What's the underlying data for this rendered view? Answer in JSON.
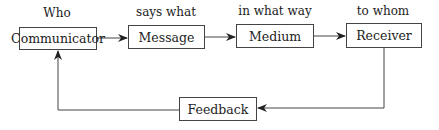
{
  "diagram": {
    "nodes": [
      {
        "id": "communicator",
        "label": "Communicator",
        "caption": "Who"
      },
      {
        "id": "message",
        "label": "Message",
        "caption": "says what"
      },
      {
        "id": "medium",
        "label": "Medium",
        "caption": "in what way"
      },
      {
        "id": "receiver",
        "label": "Receiver",
        "caption": "to whom"
      },
      {
        "id": "feedback",
        "label": "Feedback"
      }
    ],
    "edges": [
      {
        "from": "communicator",
        "to": "message"
      },
      {
        "from": "message",
        "to": "medium"
      },
      {
        "from": "medium",
        "to": "receiver"
      },
      {
        "from": "receiver",
        "to": "feedback"
      },
      {
        "from": "feedback",
        "to": "communicator"
      }
    ]
  }
}
